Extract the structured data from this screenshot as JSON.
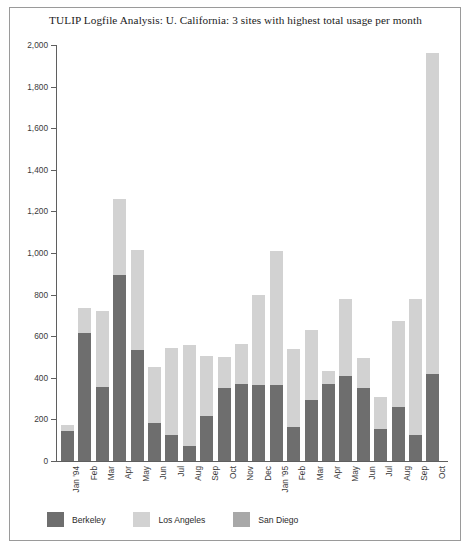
{
  "title": "TULIP Logfile Analysis: U. California: 3 sites with highest total usage per month",
  "colors": {
    "berkeley": "#6e6e6e",
    "los_angeles": "#d2d2d2",
    "san_diego": "#a8a8a8",
    "axis": "#5f5f5f",
    "frame": "#9a9a9a",
    "text": "#2b2b2b"
  },
  "legend": {
    "items": [
      {
        "label": "Berkeley",
        "color": "#6e6e6e"
      },
      {
        "label": "Los Angeles",
        "color": "#d2d2d2"
      },
      {
        "label": "San Diego",
        "color": "#a8a8a8"
      }
    ]
  },
  "yaxis": {
    "ticks": [
      "0",
      "200",
      "400",
      "600",
      "800",
      "1,000",
      "1,200",
      "1,400",
      "1,600",
      "1,800",
      "2,000"
    ],
    "min": 0,
    "max": 2000,
    "step": 200
  },
  "chart_data": {
    "type": "bar",
    "stacked": true,
    "title": "TULIP Logfile Analysis: U. California: 3 sites with highest total usage per month",
    "xlabel": "",
    "ylabel": "",
    "ylim": [
      0,
      2000
    ],
    "ytick_step": 200,
    "grid": false,
    "legend_position": "bottom-left",
    "categories": [
      "Jan '94",
      "Feb",
      "Mar",
      "Apr",
      "May",
      "Jun",
      "Jul",
      "Aug",
      "Sep",
      "Oct",
      "Nov",
      "Dec",
      "Jan '95",
      "Feb",
      "Mar",
      "Apr",
      "May",
      "Jun",
      "Jul",
      "Aug",
      "Sep",
      "Oct"
    ],
    "series": [
      {
        "name": "Berkeley",
        "color": "#6e6e6e",
        "values": [
          145,
          615,
          355,
          895,
          535,
          185,
          125,
          70,
          215,
          350,
          370,
          365,
          365,
          165,
          295,
          370,
          410,
          350,
          155,
          260,
          125,
          420
        ]
      },
      {
        "name": "Los Angeles",
        "color": "#d2d2d2",
        "values": [
          30,
          120,
          365,
          365,
          480,
          265,
          420,
          490,
          290,
          150,
          195,
          435,
          645,
          375,
          335,
          65,
          370,
          145,
          155,
          415,
          655,
          1540
        ]
      },
      {
        "name": "San Diego",
        "color": "#a8a8a8",
        "values": [
          0,
          0,
          0,
          0,
          0,
          0,
          0,
          0,
          0,
          0,
          0,
          0,
          0,
          0,
          0,
          0,
          0,
          0,
          0,
          0,
          0,
          0
        ]
      }
    ],
    "totals": [
      175,
      735,
      720,
      1260,
      1015,
      450,
      545,
      560,
      505,
      500,
      565,
      800,
      1010,
      540,
      630,
      435,
      780,
      495,
      310,
      675,
      780,
      1960
    ]
  }
}
